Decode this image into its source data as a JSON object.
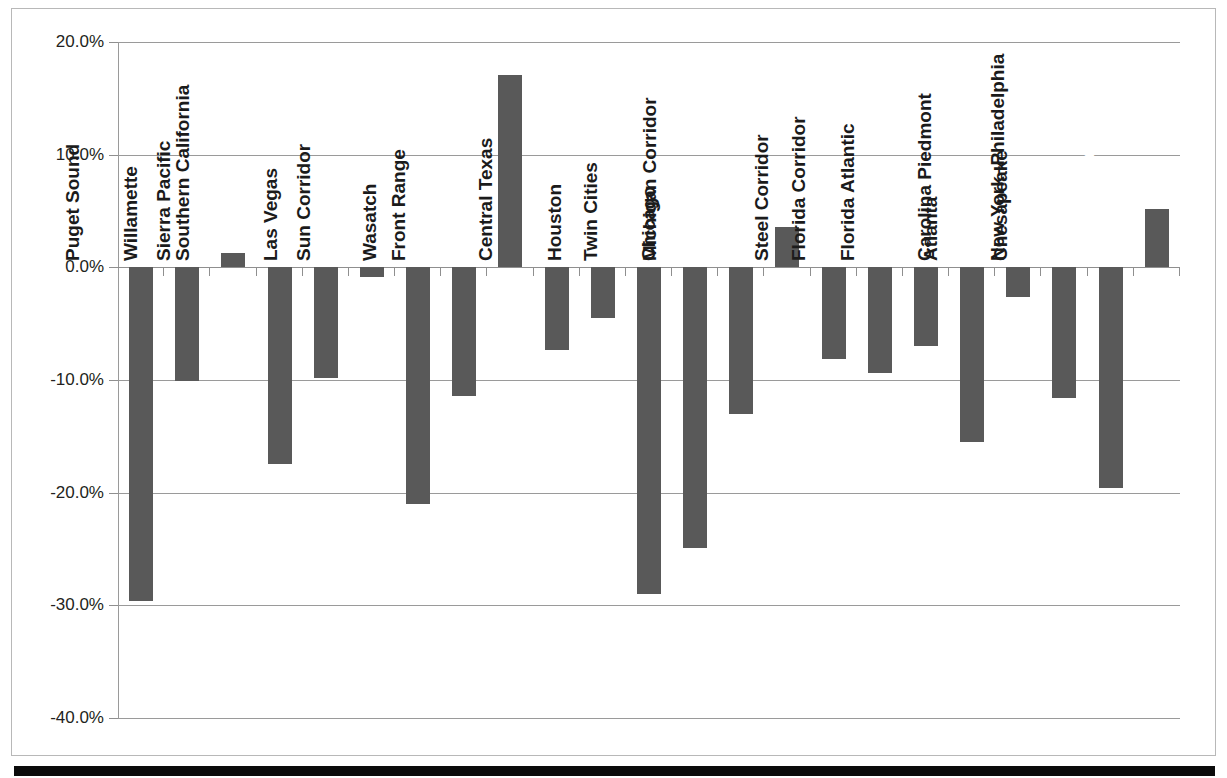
{
  "chart_data": {
    "type": "bar",
    "title": "",
    "subtitle": "",
    "xlabel": "",
    "ylabel": "",
    "orientation": "vertical",
    "grid": true,
    "legend": "none",
    "ylim": [
      -40,
      20
    ],
    "ytick_values": [
      20,
      10,
      0,
      -10,
      -20,
      -30,
      -40
    ],
    "ytick_labels": [
      "20.0%",
      "10.0%",
      "0.0%",
      "-10.0%",
      "-20.0%",
      "-30.0%",
      "-40.0%"
    ],
    "bar_color": "#595959",
    "gridline_color": "#9a9a9a",
    "categories": [
      "Puget Sound",
      "Willamette",
      "Sierra Pacific",
      "Southern California",
      "Las Vegas",
      "Sun Corridor",
      "Wasatch",
      "Front Range",
      "Dallas–Fort Worth",
      "Central Texas",
      "Houston",
      "Twin Cities",
      "Chicago",
      "Michigan Corridor",
      "Ohio Valley",
      "Steel Corridor",
      "Florida Corridor",
      "Florida Atlantic",
      "Atlanta",
      "Carolina Piedmont",
      "Chesapeake",
      "New York–Philadelphia",
      "New England"
    ],
    "values": [
      -29.6,
      -10.1,
      1.3,
      -17.5,
      -9.8,
      -0.9,
      -21.0,
      -11.4,
      17.1,
      -7.3,
      -4.5,
      -29.0,
      -24.9,
      -13.0,
      3.6,
      -8.1,
      -9.4,
      -7.0,
      -15.5,
      -2.6,
      -11.6,
      -19.6,
      5.2
    ],
    "value_labels": [
      "-29.6%",
      "-10.1%",
      "1.3%",
      "-17.5%",
      "-9.8%",
      "-0.9%",
      "-21.0%",
      "-11.4%",
      "17.1%",
      "-7.3%",
      "-4.5%",
      "-29.0%",
      "-24.9%",
      "-13.0%",
      "3.6%",
      "-8.1%",
      "-9.4%",
      "-7.0%",
      "-15.5%",
      "-2.6%",
      "-11.6%",
      "-19.6%",
      "5.2%"
    ]
  }
}
